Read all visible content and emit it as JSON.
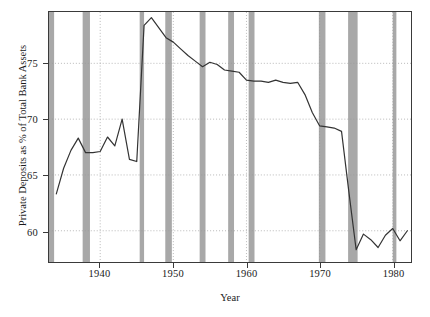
{
  "chart_data": {
    "type": "line",
    "title": "",
    "xlabel": "Year",
    "ylabel": "Private Deposits as % of Total Bank Assets",
    "xlim": [
      1933.0,
      1982.5
    ],
    "ylim": [
      57.2,
      79.6
    ],
    "xticks": [
      1940,
      1950,
      1960,
      1970,
      1980
    ],
    "xticklabels": [
      "1940",
      "1950",
      "1960",
      "1970",
      "1980"
    ],
    "yticks": [
      60,
      65,
      70,
      75
    ],
    "yticklabels": [
      "60",
      "65",
      "70",
      "75"
    ],
    "grid": true,
    "grid_style": "dotted",
    "legend": null,
    "line_color": "#333333",
    "shade_color": "#a8a8a8",
    "background": "#ffffff",
    "x": [
      1934,
      1935,
      1936,
      1937,
      1938,
      1939,
      1940,
      1941,
      1942,
      1943,
      1944,
      1945,
      1946,
      1947,
      1948,
      1949,
      1950,
      1951,
      1952,
      1953,
      1954,
      1955,
      1956,
      1957,
      1958,
      1959,
      1960,
      1961,
      1962,
      1963,
      1964,
      1965,
      1966,
      1967,
      1968,
      1969,
      1970,
      1971,
      1972,
      1973,
      1974,
      1975,
      1976,
      1977,
      1978,
      1979,
      1980,
      1981,
      1982
    ],
    "values": [
      63.3,
      65.6,
      67.2,
      68.3,
      67.0,
      67.0,
      67.1,
      68.4,
      67.6,
      70.0,
      66.4,
      66.2,
      78.4,
      79.1,
      78.2,
      77.3,
      76.9,
      76.3,
      75.7,
      75.2,
      74.7,
      75.1,
      74.9,
      74.4,
      74.3,
      74.2,
      73.5,
      73.4,
      73.4,
      73.3,
      73.5,
      73.3,
      73.2,
      73.3,
      72.2,
      70.6,
      69.4,
      69.3,
      69.2,
      68.9,
      63.5,
      58.3,
      59.7,
      59.2,
      58.5,
      59.6,
      60.2,
      59.1,
      60.0
    ],
    "series_name": "Private Deposits as % of Total Bank Assets",
    "shaded_bands": [
      {
        "start": 1933.0,
        "end": 1933.7
      },
      {
        "start": 1937.6,
        "end": 1938.6
      },
      {
        "start": 1945.4,
        "end": 1946.0
      },
      {
        "start": 1948.9,
        "end": 1949.8
      },
      {
        "start": 1953.6,
        "end": 1954.4
      },
      {
        "start": 1957.5,
        "end": 1958.3
      },
      {
        "start": 1960.3,
        "end": 1961.1
      },
      {
        "start": 1969.9,
        "end": 1970.8
      },
      {
        "start": 1973.9,
        "end": 1975.2
      },
      {
        "start": 1980.0,
        "end": 1980.5
      }
    ],
    "shaded_bands_meaning": "recession periods"
  },
  "axes": {
    "ylabel": "Private Deposits as % of Total Bank Assets",
    "xlabel": "Year"
  }
}
